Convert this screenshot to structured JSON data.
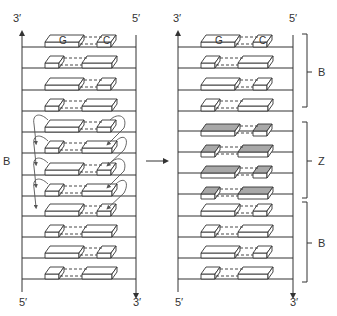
{
  "figure": {
    "left_panel": {
      "top_left_label": "3′",
      "top_right_label": "5′",
      "bottom_left_label": "5′",
      "bottom_right_label": "3′",
      "side_label": "B",
      "first_pair": {
        "left_base": "G",
        "right_base": "C"
      },
      "rows": 12,
      "flip_arrows_rows": [
        4,
        5,
        6,
        7
      ]
    },
    "transition_arrow": "→",
    "right_panel": {
      "top_left_label": "3′",
      "top_right_label": "5′",
      "bottom_left_label": "5′",
      "bottom_right_label": "3′",
      "first_pair": {
        "left_base": "G",
        "right_base": "C"
      },
      "regions": [
        {
          "label": "B",
          "form": "B-DNA"
        },
        {
          "label": "Z",
          "form": "Z-DNA"
        },
        {
          "label": "B",
          "form": "B-DNA"
        }
      ]
    },
    "colors": {
      "line": "#333333",
      "block_fill": "#ffffff",
      "z_block_fill": "#a8a8a8",
      "flip_arrow": "#555555"
    }
  }
}
